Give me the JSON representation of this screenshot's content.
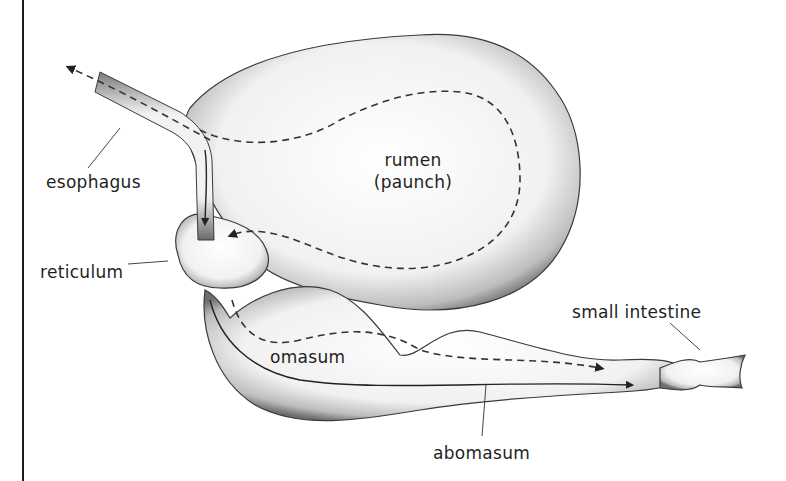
{
  "labels": {
    "esophagus": "esophagus",
    "rumen": "rumen",
    "rumen_alt": "(paunch)",
    "reticulum": "reticulum",
    "omasum": "omasum",
    "abomasum": "abomasum",
    "small_intestine": "small intestine"
  },
  "colors": {
    "outline": "#2a2a2a",
    "shade": "#8a8a8a",
    "fill": "#f4f4f4",
    "path": "#333333"
  }
}
